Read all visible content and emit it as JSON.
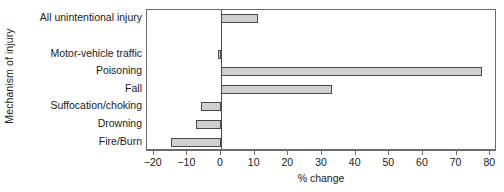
{
  "chart_data": {
    "type": "bar",
    "orientation": "horizontal",
    "title": "",
    "xlabel": "% change",
    "ylabel": "Mechanism of injury",
    "categories": [
      "All unintentional injury",
      "",
      "Motor-vehicle traffic",
      "Poisoning",
      "Fall",
      "Suffocation/choking",
      "Drowning",
      "Fire/Burn"
    ],
    "values": [
      11,
      null,
      -1,
      77.5,
      33,
      -6,
      -7.5,
      -15
    ],
    "xlim": [
      -22,
      82
    ],
    "xticks": [
      -20,
      -10,
      0,
      10,
      20,
      30,
      40,
      50,
      60,
      70,
      80
    ],
    "xtick_labels": [
      "−20",
      "−10",
      "0",
      "10",
      "20",
      "30",
      "40",
      "50",
      "60",
      "70",
      "80"
    ],
    "grid": false,
    "legend": null,
    "zero_line": 0,
    "bar_fill_color": "#cfcfcf",
    "bar_edge_color": "#4a4a4a",
    "axis_color": "#6b6b6b",
    "background_color": "#ffffff"
  }
}
